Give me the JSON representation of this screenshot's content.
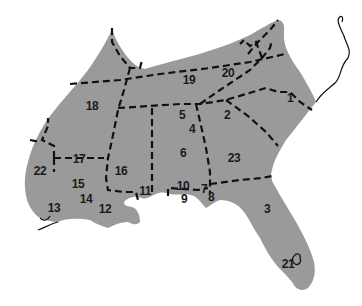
{
  "map": {
    "type": "regional division map (southeastern United States)",
    "fill_color": "#9a9a9a",
    "boundary_style": "dashed black lines",
    "regions": [
      {
        "id": "1",
        "label": "1",
        "x": 290,
        "y": 102
      },
      {
        "id": "2",
        "label": "2",
        "x": 227,
        "y": 119
      },
      {
        "id": "3",
        "label": "3",
        "x": 267,
        "y": 213
      },
      {
        "id": "4",
        "label": "4",
        "x": 192,
        "y": 133
      },
      {
        "id": "5",
        "label": "5",
        "x": 182,
        "y": 119
      },
      {
        "id": "6",
        "label": "6",
        "x": 183,
        "y": 157
      },
      {
        "id": "7",
        "label": "7",
        "x": 204,
        "y": 193
      },
      {
        "id": "8",
        "label": "8",
        "x": 211,
        "y": 201
      },
      {
        "id": "9",
        "label": "9",
        "x": 184,
        "y": 203
      },
      {
        "id": "10",
        "label": "10",
        "x": 183,
        "y": 190
      },
      {
        "id": "11",
        "label": "11",
        "x": 145,
        "y": 195
      },
      {
        "id": "12",
        "label": "12",
        "x": 105,
        "y": 213
      },
      {
        "id": "13",
        "label": "13",
        "x": 54,
        "y": 212
      },
      {
        "id": "14",
        "label": "14",
        "x": 86,
        "y": 203
      },
      {
        "id": "15",
        "label": "15",
        "x": 78,
        "y": 188
      },
      {
        "id": "16",
        "label": "16",
        "x": 121,
        "y": 175
      },
      {
        "id": "17",
        "label": "17",
        "x": 79,
        "y": 163
      },
      {
        "id": "18",
        "label": "18",
        "x": 92,
        "y": 110
      },
      {
        "id": "19",
        "label": "19",
        "x": 189,
        "y": 84
      },
      {
        "id": "20",
        "label": "20",
        "x": 228,
        "y": 77
      },
      {
        "id": "21",
        "label": "21",
        "x": 288,
        "y": 268
      },
      {
        "id": "22",
        "label": "22",
        "x": 40,
        "y": 175
      },
      {
        "id": "23",
        "label": "23",
        "x": 234,
        "y": 162
      }
    ]
  }
}
